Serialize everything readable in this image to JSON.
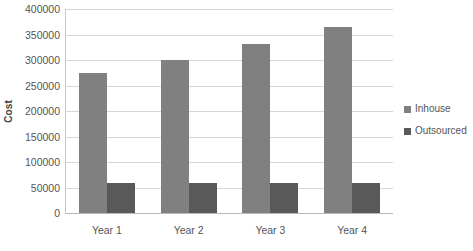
{
  "chart_data": {
    "type": "bar",
    "title": "",
    "subtitle": "",
    "xlabel": "",
    "ylabel": "Cost",
    "categories": [
      "Year 1",
      "Year 2",
      "Year 3",
      "Year 4"
    ],
    "series": [
      {
        "name": "Inhouse",
        "color": "#808080",
        "values": [
          275000,
          300000,
          332000,
          365000
        ]
      },
      {
        "name": "Outsourced",
        "color": "#595959",
        "values": [
          59000,
          59000,
          59000,
          59000
        ]
      }
    ],
    "ylim": [
      0,
      400000
    ],
    "ytick_step": 50000,
    "ytick_labels": [
      "400000",
      "350000",
      "300000",
      "250000",
      "200000",
      "150000",
      "100000",
      "50000",
      "0"
    ],
    "ytick_values": [
      400000,
      350000,
      300000,
      250000,
      200000,
      150000,
      100000,
      50000,
      0
    ],
    "grid": "horizontal",
    "legend_position": "right",
    "legend_entries": [
      "Inhouse",
      "Outsourced"
    ],
    "background_color": "#ffffff",
    "gridline_color": "#d6d6d6",
    "axis_color": "#b8b8b8"
  }
}
